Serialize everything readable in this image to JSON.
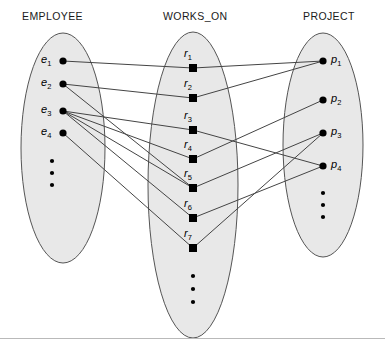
{
  "diagram": {
    "type": "er-instance-diagram",
    "colors": {
      "oval_fill": "#e8e8e8",
      "oval_stroke": "#555555",
      "edge": "#444444",
      "node": "#000000",
      "header_text": "#1a1a1a"
    },
    "sets": [
      {
        "id": "employee",
        "header": "EMPLOYEE",
        "header_x": 22,
        "header_y": 10,
        "node_shape": "circle",
        "label_side": "left",
        "oval": {
          "cx": 63,
          "cy": 148,
          "rx": 42,
          "ry": 115
        },
        "nodes": [
          {
            "id": "e1",
            "label": "e",
            "sub": "1",
            "x": 63,
            "y": 61
          },
          {
            "id": "e2",
            "label": "e",
            "sub": "2",
            "x": 63,
            "y": 84
          },
          {
            "id": "e3",
            "label": "e",
            "sub": "3",
            "x": 63,
            "y": 111
          },
          {
            "id": "e4",
            "label": "e",
            "sub": "4",
            "x": 63,
            "y": 133
          }
        ],
        "ellipsis": [
          {
            "x": 52,
            "y": 161
          },
          {
            "x": 52,
            "y": 173
          },
          {
            "x": 52,
            "y": 185
          }
        ]
      },
      {
        "id": "works_on",
        "header": "WORKS_ON",
        "header_x": 163,
        "header_y": 10,
        "node_shape": "square",
        "label_side": "above-left",
        "oval": {
          "cx": 193,
          "cy": 185,
          "rx": 45,
          "ry": 153
        },
        "nodes": [
          {
            "id": "r1",
            "label": "r",
            "sub": "1",
            "x": 193,
            "y": 68
          },
          {
            "id": "r2",
            "label": "r",
            "sub": "2",
            "x": 193,
            "y": 98
          },
          {
            "id": "r3",
            "label": "r",
            "sub": "3",
            "x": 193,
            "y": 130
          },
          {
            "id": "r4",
            "label": "r",
            "sub": "4",
            "x": 193,
            "y": 159
          },
          {
            "id": "r5",
            "label": "r",
            "sub": "5",
            "x": 193,
            "y": 188
          },
          {
            "id": "r6",
            "label": "r",
            "sub": "6",
            "x": 193,
            "y": 218
          },
          {
            "id": "r7",
            "label": "r",
            "sub": "7",
            "x": 193,
            "y": 248
          }
        ],
        "ellipsis": [
          {
            "x": 193,
            "y": 276
          },
          {
            "x": 193,
            "y": 289
          },
          {
            "x": 193,
            "y": 302
          }
        ]
      },
      {
        "id": "project",
        "header": "PROJECT",
        "header_x": 303,
        "header_y": 10,
        "node_shape": "circle",
        "label_side": "right",
        "oval": {
          "cx": 323,
          "cy": 145,
          "rx": 40,
          "ry": 112
        },
        "nodes": [
          {
            "id": "p1",
            "label": "p",
            "sub": "1",
            "x": 323,
            "y": 61
          },
          {
            "id": "p2",
            "label": "p",
            "sub": "2",
            "x": 323,
            "y": 100
          },
          {
            "id": "p3",
            "label": "p",
            "sub": "3",
            "x": 323,
            "y": 133
          },
          {
            "id": "p4",
            "label": "p",
            "sub": "4",
            "x": 323,
            "y": 166
          }
        ],
        "ellipsis": [
          {
            "x": 323,
            "y": 193
          },
          {
            "x": 323,
            "y": 205
          },
          {
            "x": 323,
            "y": 217
          }
        ]
      }
    ],
    "edges": [
      {
        "from": "e1",
        "to": "r1"
      },
      {
        "from": "e2",
        "to": "r2"
      },
      {
        "from": "e2",
        "to": "r5"
      },
      {
        "from": "e3",
        "to": "r3"
      },
      {
        "from": "e3",
        "to": "r4"
      },
      {
        "from": "e3",
        "to": "r5"
      },
      {
        "from": "e3",
        "to": "r6"
      },
      {
        "from": "e4",
        "to": "r7"
      },
      {
        "from": "r1",
        "to": "p1"
      },
      {
        "from": "r2",
        "to": "p1"
      },
      {
        "from": "r3",
        "to": "p4"
      },
      {
        "from": "r4",
        "to": "p2"
      },
      {
        "from": "r5",
        "to": "p3"
      },
      {
        "from": "r6",
        "to": "p4"
      },
      {
        "from": "r7",
        "to": "p3"
      }
    ]
  }
}
